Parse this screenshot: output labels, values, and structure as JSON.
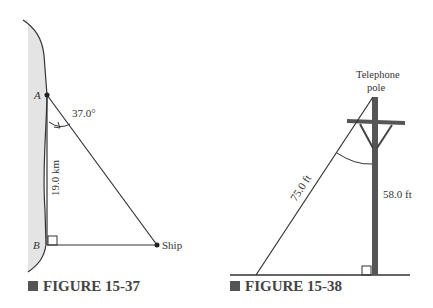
{
  "figures": [
    {
      "caption": "FIGURE 15-37",
      "labels": {
        "point_a": "A",
        "point_b": "B",
        "ship": "Ship",
        "angle": "37.0°",
        "distance": "19.0 km"
      }
    },
    {
      "caption": "FIGURE 15-38",
      "labels": {
        "pole_line1": "Telephone",
        "pole_line2": "pole",
        "wire_length": "75.0 ft",
        "pole_height": "58.0 ft"
      }
    }
  ],
  "colors": {
    "shore_fill": "#e4e4e4",
    "line": "#333333",
    "pole": "#555555",
    "caption_square": "#555555"
  }
}
